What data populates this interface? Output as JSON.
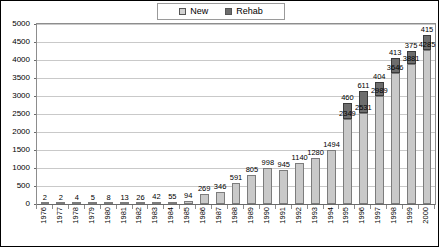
{
  "legend": {
    "position": "top-center",
    "items": [
      {
        "label": "New",
        "color": "#c9c9c9",
        "icon": "square-swatch-light"
      },
      {
        "label": "Rehab",
        "color": "#6d6d6d",
        "icon": "square-swatch-dark"
      }
    ]
  },
  "chart_data": {
    "type": "bar",
    "stacked": true,
    "title": "",
    "xlabel": "",
    "ylabel": "",
    "ylim": [
      0,
      5000
    ],
    "ytick_step": 500,
    "grid": true,
    "yticks": [
      "0",
      "500",
      "1000",
      "1500",
      "2000",
      "2500",
      "3000",
      "3500",
      "4000",
      "4500",
      "5000"
    ],
    "categories": [
      "1976",
      "1977",
      "1978",
      "1979",
      "1980",
      "1981",
      "1982",
      "1983",
      "1984",
      "1985",
      "1986",
      "1987",
      "1988",
      "1989",
      "1990",
      "1991",
      "1992",
      "1993",
      "1994",
      "1995",
      "1996",
      "1997",
      "1998",
      "1999",
      "2000"
    ],
    "series": [
      {
        "name": "New",
        "color": "#c9c9c9",
        "values": [
          2,
          2,
          4,
          5,
          8,
          13,
          26,
          42,
          55,
          94,
          269,
          346,
          591,
          805,
          998,
          945,
          1140,
          1280,
          1494,
          2349,
          2531,
          2989,
          3646,
          3881,
          4285
        ]
      },
      {
        "name": "Rehab",
        "color": "#6d6d6d",
        "values": [
          0,
          0,
          0,
          0,
          0,
          0,
          0,
          0,
          0,
          0,
          0,
          0,
          0,
          0,
          0,
          0,
          0,
          0,
          0,
          460,
          611,
          404,
          413,
          375,
          415
        ]
      }
    ],
    "data_labels": {
      "New": [
        "2",
        "2",
        "4",
        "5",
        "8",
        "13",
        "26",
        "42",
        "55",
        "94",
        "269",
        "346",
        "591",
        "805",
        "998",
        "945",
        "1140",
        "1280",
        "1494",
        "2349",
        "2531",
        "2989",
        "3646",
        "3881",
        "4285"
      ],
      "Rehab": [
        "",
        "",
        "",
        "",
        "",
        "",
        "",
        "",
        "",
        "",
        "",
        "",
        "",
        "",
        "",
        "",
        "",
        "",
        "",
        "460",
        "611",
        "404",
        "413",
        "375",
        "415"
      ]
    }
  }
}
